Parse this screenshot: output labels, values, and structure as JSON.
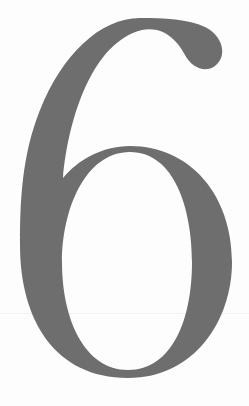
{
  "page": {
    "chapter_number": "6",
    "glyph_color": "#6e6e6e",
    "background_color": "#fdfdfd"
  }
}
